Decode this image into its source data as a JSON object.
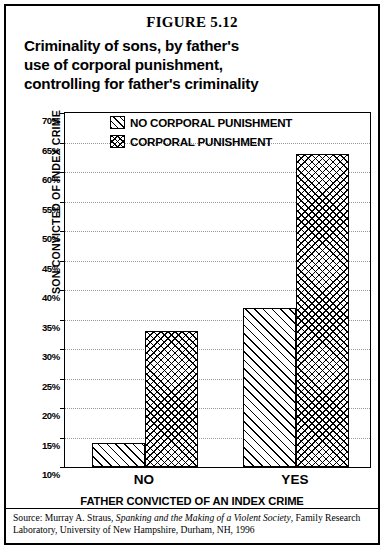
{
  "figure": {
    "number_label": "FIGURE 5.12",
    "title_lines": [
      "Criminality of sons, by father's",
      "use of corporal punishment,",
      "controlling for father's criminality"
    ]
  },
  "source": {
    "prefix": "Source: Murray A. Straus, ",
    "work_title": "Spanking and the Making of a Violent Society",
    "suffix": ", Family Research Laboratory, University of New Hampshire, Durham, NH, 1996"
  },
  "chart_data": {
    "type": "bar",
    "title": "Criminality of sons, by father's use of corporal punishment, controlling for father's criminality",
    "xlabel": "FATHER CONVICTED OF AN INDEX CRIME",
    "ylabel": "SON CONVICTED OF INDEX CRIME",
    "categories": [
      "NO",
      "YES"
    ],
    "series": [
      {
        "name": "NO CORPORAL PUNISHMENT",
        "pattern": "diagonal-hatch",
        "values": [
          14,
          37
        ]
      },
      {
        "name": "CORPORAL PUNISHMENT",
        "pattern": "crosshatch",
        "values": [
          33,
          63
        ]
      }
    ],
    "ylim": [
      10,
      70
    ],
    "ytick_step": 5,
    "ytick_labels": [
      "70%",
      "65%",
      "60%",
      "55%",
      "50%",
      "45%",
      "40%",
      "35%",
      "30%",
      "25%",
      "20%",
      "15%",
      "10%"
    ],
    "ytick_values": [
      70,
      65,
      60,
      55,
      50,
      45,
      40,
      35,
      30,
      25,
      20,
      15,
      10
    ],
    "grid": true,
    "grid_style": "dotted",
    "legend_position": "inside-top-left",
    "value_suffix": "%",
    "colors": {
      "ink": "#000000",
      "background": "#ffffff",
      "gridline": "#9a9a9a"
    }
  }
}
